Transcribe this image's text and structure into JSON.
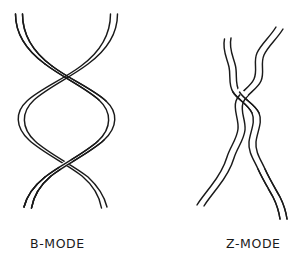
{
  "figure": {
    "background_color": "#ffffff",
    "stroke_color": "#1a1a1a",
    "title": "",
    "panels": [
      {
        "id": "b-mode",
        "caption": "B-MODE",
        "description": "Right-handed smooth double helix with two ribbon strands, three crossover points and two lens-shaped openings"
      },
      {
        "id": "z-mode",
        "caption": "Z-MODE",
        "description": "Left-handed zigzag double helix with two narrow wavy ribbon strands crossing in a zig-zag pattern"
      }
    ]
  },
  "captions": {
    "b_mode": "B-MODE",
    "z_mode": "Z-MODE"
  }
}
